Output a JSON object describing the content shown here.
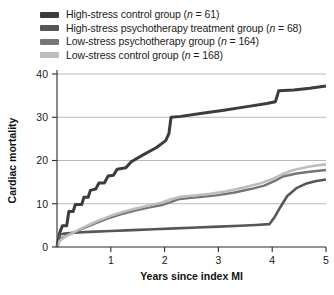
{
  "chart_data": {
    "type": "line",
    "title": "",
    "xlabel": "Years since index MI",
    "ylabel": "Cardiac mortality",
    "xlim": [
      0,
      5
    ],
    "ylim": [
      0,
      40
    ],
    "xticks": [
      1,
      2,
      3,
      4,
      5
    ],
    "xtick_labels": [
      "1",
      "2",
      "3",
      "4",
      "5"
    ],
    "yticks": [
      0,
      10,
      20,
      30,
      40
    ],
    "ytick_labels": [
      "0",
      "10",
      "20",
      "30",
      "40"
    ],
    "grid": "horizontal",
    "legend_position": "top",
    "series": [
      {
        "name": "High-stress control group",
        "n": 61,
        "legend_label": "High-stress control group (n = 61)",
        "color": "#3c3c3c",
        "width": 3.0,
        "points": [
          [
            0.0,
            0.0
          ],
          [
            0.05,
            3.3
          ],
          [
            0.1,
            4.9
          ],
          [
            0.18,
            4.9
          ],
          [
            0.22,
            8.2
          ],
          [
            0.3,
            8.2
          ],
          [
            0.34,
            9.8
          ],
          [
            0.46,
            9.8
          ],
          [
            0.5,
            11.5
          ],
          [
            0.58,
            11.5
          ],
          [
            0.62,
            13.1
          ],
          [
            0.72,
            13.4
          ],
          [
            0.78,
            14.8
          ],
          [
            0.88,
            14.8
          ],
          [
            0.95,
            16.4
          ],
          [
            1.05,
            16.6
          ],
          [
            1.12,
            18.0
          ],
          [
            1.28,
            18.3
          ],
          [
            1.38,
            19.7
          ],
          [
            1.6,
            21.3
          ],
          [
            1.85,
            23.0
          ],
          [
            2.02,
            24.6
          ],
          [
            2.08,
            26.2
          ],
          [
            2.12,
            30.0
          ],
          [
            2.3,
            30.2
          ],
          [
            2.7,
            30.9
          ],
          [
            3.1,
            31.6
          ],
          [
            3.5,
            32.4
          ],
          [
            3.9,
            33.2
          ],
          [
            4.06,
            33.6
          ],
          [
            4.12,
            36.1
          ],
          [
            4.4,
            36.3
          ],
          [
            4.7,
            36.7
          ],
          [
            5.0,
            37.2
          ]
        ]
      },
      {
        "name": "High-stress psychotherapy treatment group",
        "n": 68,
        "legend_label": "High-stress psychotherapy treatment group (n = 68)",
        "color": "#565656",
        "width": 2.6,
        "points": [
          [
            0.0,
            0.0
          ],
          [
            0.06,
            2.9
          ],
          [
            0.14,
            3.1
          ],
          [
            0.3,
            3.3
          ],
          [
            0.6,
            3.5
          ],
          [
            1.0,
            3.7
          ],
          [
            1.4,
            3.9
          ],
          [
            1.8,
            4.1
          ],
          [
            2.2,
            4.3
          ],
          [
            2.6,
            4.5
          ],
          [
            3.0,
            4.7
          ],
          [
            3.4,
            4.9
          ],
          [
            3.7,
            5.1
          ],
          [
            3.95,
            5.3
          ],
          [
            4.05,
            7.0
          ],
          [
            4.15,
            9.2
          ],
          [
            4.28,
            11.8
          ],
          [
            4.45,
            13.6
          ],
          [
            4.62,
            14.6
          ],
          [
            4.8,
            15.2
          ],
          [
            5.0,
            15.6
          ]
        ]
      },
      {
        "name": "Low-stress psychotherapy group",
        "n": 164,
        "legend_label": "Low-stress psychotherapy group (n = 164)",
        "color": "#767676",
        "width": 2.4,
        "points": [
          [
            0.0,
            0.0
          ],
          [
            0.05,
            1.6
          ],
          [
            0.12,
            2.3
          ],
          [
            0.25,
            3.0
          ],
          [
            0.45,
            4.1
          ],
          [
            0.7,
            5.4
          ],
          [
            0.95,
            6.6
          ],
          [
            1.2,
            7.6
          ],
          [
            1.45,
            8.4
          ],
          [
            1.7,
            9.1
          ],
          [
            1.95,
            9.7
          ],
          [
            2.1,
            10.3
          ],
          [
            2.25,
            11.0
          ],
          [
            2.45,
            11.3
          ],
          [
            2.7,
            11.6
          ],
          [
            3.0,
            12.0
          ],
          [
            3.3,
            12.6
          ],
          [
            3.6,
            13.4
          ],
          [
            3.85,
            14.2
          ],
          [
            4.05,
            15.3
          ],
          [
            4.2,
            16.3
          ],
          [
            4.45,
            17.0
          ],
          [
            4.7,
            17.4
          ],
          [
            5.0,
            17.8
          ]
        ]
      },
      {
        "name": "Low-stress control group",
        "n": 168,
        "legend_label": "Low-stress control group (n = 168)",
        "color": "#bdbdbd",
        "width": 2.6,
        "points": [
          [
            0.0,
            0.0
          ],
          [
            0.05,
            1.4
          ],
          [
            0.12,
            2.1
          ],
          [
            0.28,
            3.2
          ],
          [
            0.5,
            4.6
          ],
          [
            0.75,
            6.0
          ],
          [
            1.0,
            7.2
          ],
          [
            1.25,
            8.2
          ],
          [
            1.5,
            9.0
          ],
          [
            1.75,
            9.7
          ],
          [
            1.95,
            10.3
          ],
          [
            2.1,
            11.0
          ],
          [
            2.3,
            11.6
          ],
          [
            2.55,
            11.9
          ],
          [
            2.85,
            12.3
          ],
          [
            3.15,
            12.9
          ],
          [
            3.45,
            13.7
          ],
          [
            3.75,
            14.6
          ],
          [
            4.0,
            15.7
          ],
          [
            4.18,
            16.8
          ],
          [
            4.4,
            17.8
          ],
          [
            4.65,
            18.5
          ],
          [
            4.85,
            18.9
          ],
          [
            5.0,
            19.1
          ]
        ]
      }
    ]
  }
}
